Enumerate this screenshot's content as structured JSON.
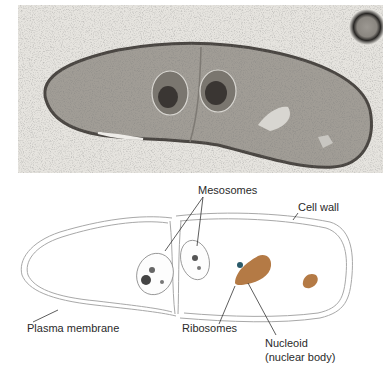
{
  "figure": {
    "micrograph": {
      "description": "Electron micrograph of a dividing rod-shaped bacterium",
      "colors": {
        "background": "#e6e4df",
        "cell_fill": "#a19d96",
        "cell_wall": "#4a4642",
        "mesosome_dark": "#3a3633",
        "light_patch": "#d8d6d1",
        "spore_ring": "#2a2826"
      }
    },
    "diagram": {
      "colors": {
        "outline": "#9a9a9a",
        "nucleoid": "#b47a45",
        "leader_line": "#333333",
        "label_text": "#2a2a2a"
      },
      "labels": {
        "mesosomes": "Mesosomes",
        "cell_wall": "Cell wall",
        "plasma_membrane": "Plasma membrane",
        "ribosomes": "Ribosomes",
        "nucleoid": "Nucleoid",
        "nucleoid_sub": "(nuclear body)"
      }
    }
  }
}
